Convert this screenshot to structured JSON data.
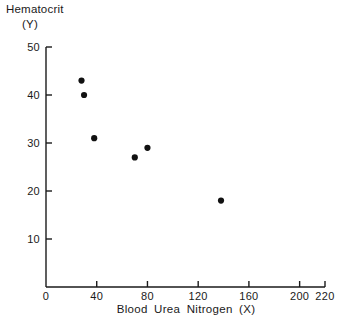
{
  "chart_data": {
    "type": "scatter",
    "title": "",
    "ylabel_line1": "Hematocrit",
    "ylabel_line2": "(Y)",
    "xlabel": "Blood Urea Nitrogen (X)",
    "xlim": [
      0,
      220
    ],
    "ylim": [
      0,
      50
    ],
    "grid": false,
    "legend": null,
    "xticks": [
      0,
      40,
      80,
      120,
      160,
      200,
      220
    ],
    "xtick_labels": [
      "0",
      "40",
      "80",
      "120",
      "160",
      "200",
      "220"
    ],
    "yticks": [
      10,
      20,
      30,
      40,
      50
    ],
    "ytick_labels": [
      "10",
      "20",
      "30",
      "40",
      "50"
    ],
    "x": [
      28,
      30,
      38,
      70,
      80,
      138
    ],
    "y": [
      43,
      40,
      31,
      27,
      29,
      18
    ],
    "points": [
      {
        "x": 28,
        "y": 43
      },
      {
        "x": 30,
        "y": 40
      },
      {
        "x": 38,
        "y": 31
      },
      {
        "x": 70,
        "y": 27
      },
      {
        "x": 80,
        "y": 29
      },
      {
        "x": 138,
        "y": 18
      }
    ],
    "marker": "filled-circle",
    "marker_color": "#111111",
    "axis_color": "#1a1a1a"
  }
}
